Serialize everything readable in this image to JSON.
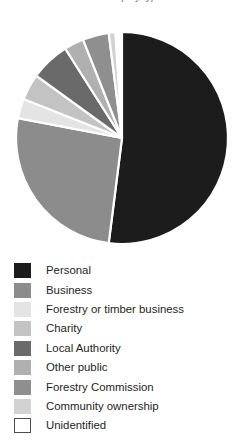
{
  "figure": {
    "caption_remnant": "ownership by type",
    "background": "#ffffff"
  },
  "legend": {
    "position": "below-chart",
    "items": [
      {
        "label": "Personal",
        "color": "#1c1c1c",
        "border": "#1c1c1c"
      },
      {
        "label": "Business",
        "color": "#8c8c8c",
        "border": "#8c8c8c"
      },
      {
        "label": "Forestry or timber business",
        "color": "#e4e4e4",
        "border": "#e4e4e4"
      },
      {
        "label": "Charity",
        "color": "#c3c3c3",
        "border": "#c3c3c3"
      },
      {
        "label": "Local Authority",
        "color": "#6a6a6a",
        "border": "#6a6a6a"
      },
      {
        "label": "Other public",
        "color": "#b0b0b0",
        "border": "#b0b0b0"
      },
      {
        "label": "Forestry Commission",
        "color": "#8f8f8f",
        "border": "#8f8f8f"
      },
      {
        "label": "Community ownership",
        "color": "#d2d2d2",
        "border": "#d2d2d2"
      },
      {
        "label": "Unidentified",
        "color": "#ffffff",
        "border": "#4d4d4d"
      }
    ]
  },
  "chart_data": {
    "type": "pie",
    "title": "",
    "subtitle": "",
    "xlabel": "",
    "ylabel": "",
    "grid": false,
    "legend_position": "bottom-left",
    "start_angle_deg": 0,
    "direction": "clockwise",
    "center_px": [
      122,
      138
    ],
    "radius_px": 106,
    "slice_gap_color": "#ffffff",
    "categories": [
      "Personal",
      "Business",
      "Forestry or timber business",
      "Charity",
      "Local Authority",
      "Other public",
      "Forestry Commission",
      "Community ownership",
      "Unidentified"
    ],
    "values": [
      52,
      26,
      3,
      4,
      6,
      3,
      4,
      1,
      1
    ],
    "unit": "percent",
    "colors": [
      "#1c1c1c",
      "#8c8c8c",
      "#e4e4e4",
      "#c3c3c3",
      "#6a6a6a",
      "#b0b0b0",
      "#8f8f8f",
      "#d2d2d2",
      "#ffffff"
    ],
    "series": [
      {
        "name": "Woodland ownership by type",
        "values": [
          52,
          26,
          3,
          4,
          6,
          3,
          4,
          1,
          1
        ]
      }
    ]
  }
}
